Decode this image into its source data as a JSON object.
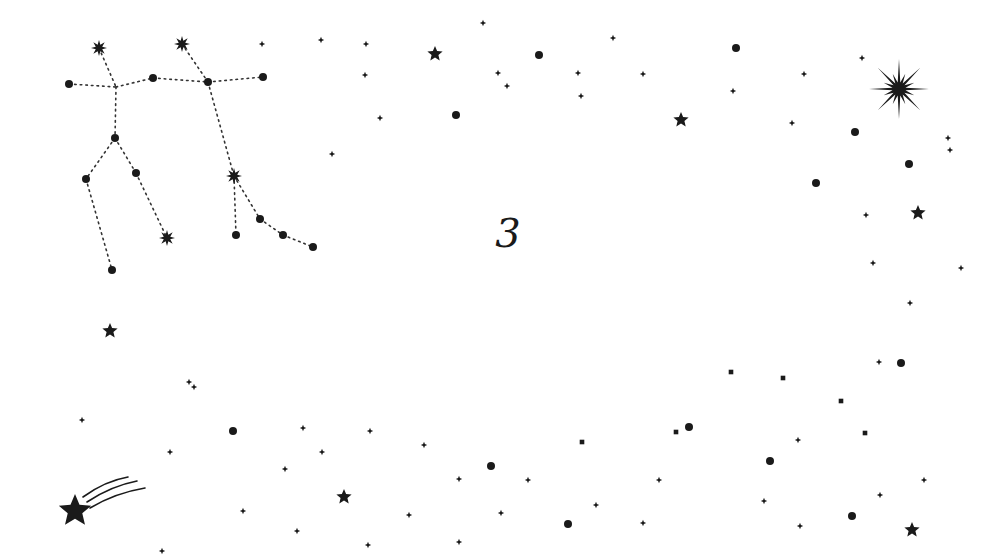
{
  "scene": {
    "background": "#ffffff",
    "ink_color": "#1a1a1a",
    "center_label": "3"
  },
  "constellation": {
    "name_depicted": "Gemini",
    "nodes": [
      {
        "id": "a",
        "x": 99,
        "y": 48,
        "type": "burst"
      },
      {
        "id": "b",
        "x": 182,
        "y": 44,
        "type": "burst"
      },
      {
        "id": "c",
        "x": 69,
        "y": 84,
        "type": "dot"
      },
      {
        "id": "d",
        "x": 116,
        "y": 87,
        "type": "junction"
      },
      {
        "id": "e",
        "x": 153,
        "y": 78,
        "type": "dot"
      },
      {
        "id": "f",
        "x": 208,
        "y": 82,
        "type": "dot"
      },
      {
        "id": "g",
        "x": 263,
        "y": 77,
        "type": "dot"
      },
      {
        "id": "h",
        "x": 115,
        "y": 138,
        "type": "dot"
      },
      {
        "id": "i",
        "x": 86,
        "y": 179,
        "type": "dot"
      },
      {
        "id": "j",
        "x": 136,
        "y": 173,
        "type": "dot"
      },
      {
        "id": "k",
        "x": 167,
        "y": 238,
        "type": "burst"
      },
      {
        "id": "l",
        "x": 112,
        "y": 270,
        "type": "dot"
      },
      {
        "id": "m",
        "x": 234,
        "y": 176,
        "type": "burst"
      },
      {
        "id": "n",
        "x": 236,
        "y": 235,
        "type": "dot"
      },
      {
        "id": "o",
        "x": 260,
        "y": 219,
        "type": "dot"
      },
      {
        "id": "p",
        "x": 283,
        "y": 235,
        "type": "dot"
      },
      {
        "id": "q",
        "x": 313,
        "y": 247,
        "type": "dot"
      }
    ],
    "edges": [
      [
        "a",
        "d"
      ],
      [
        "c",
        "d"
      ],
      [
        "d",
        "e"
      ],
      [
        "e",
        "f"
      ],
      [
        "f",
        "g"
      ],
      [
        "b",
        "f"
      ],
      [
        "d",
        "h"
      ],
      [
        "h",
        "i"
      ],
      [
        "i",
        "l"
      ],
      [
        "h",
        "j"
      ],
      [
        "j",
        "k"
      ],
      [
        "f",
        "m"
      ],
      [
        "m",
        "n"
      ],
      [
        "m",
        "o"
      ],
      [
        "o",
        "p"
      ],
      [
        "p",
        "q"
      ]
    ]
  },
  "stars": {
    "diamonds": [
      [
        262,
        44
      ],
      [
        321,
        40
      ],
      [
        366,
        44
      ],
      [
        365,
        75
      ],
      [
        380,
        118
      ],
      [
        332,
        154
      ],
      [
        483,
        23
      ],
      [
        498,
        73
      ],
      [
        507,
        86
      ],
      [
        578,
        73
      ],
      [
        581,
        96
      ],
      [
        613,
        38
      ],
      [
        643,
        74
      ],
      [
        733,
        91
      ],
      [
        804,
        74
      ],
      [
        792,
        123
      ],
      [
        862,
        58
      ],
      [
        948,
        138
      ],
      [
        950,
        150
      ],
      [
        866,
        215
      ],
      [
        873,
        263
      ],
      [
        961,
        268
      ],
      [
        910,
        303
      ],
      [
        879,
        362
      ],
      [
        82,
        420
      ],
      [
        189,
        382
      ],
      [
        194,
        387
      ],
      [
        170,
        452
      ],
      [
        243,
        511
      ],
      [
        303,
        428
      ],
      [
        285,
        469
      ],
      [
        370,
        431
      ],
      [
        322,
        452
      ],
      [
        424,
        445
      ],
      [
        459,
        479
      ],
      [
        297,
        531
      ],
      [
        368,
        545
      ],
      [
        409,
        515
      ],
      [
        459,
        542
      ],
      [
        501,
        513
      ],
      [
        528,
        480
      ],
      [
        162,
        551
      ],
      [
        659,
        480
      ],
      [
        643,
        523
      ],
      [
        596,
        505
      ],
      [
        798,
        440
      ],
      [
        764,
        501
      ],
      [
        800,
        526
      ],
      [
        880,
        495
      ],
      [
        924,
        480
      ]
    ],
    "squares": [
      [
        582,
        442
      ],
      [
        676,
        432
      ],
      [
        731,
        372
      ],
      [
        783,
        378
      ],
      [
        841,
        401
      ],
      [
        865,
        433
      ]
    ],
    "dots": [
      [
        539,
        55
      ],
      [
        456,
        115
      ],
      [
        736,
        48
      ],
      [
        855,
        132
      ],
      [
        909,
        164
      ],
      [
        816,
        183
      ],
      [
        901,
        363
      ],
      [
        233,
        431
      ],
      [
        491,
        466
      ],
      [
        568,
        524
      ],
      [
        689,
        427
      ],
      [
        770,
        461
      ],
      [
        852,
        516
      ]
    ],
    "five_point": [
      {
        "x": 435,
        "y": 54,
        "r": 8
      },
      {
        "x": 681,
        "y": 120,
        "r": 8
      },
      {
        "x": 918,
        "y": 213,
        "r": 8
      },
      {
        "x": 110,
        "y": 331,
        "r": 8
      },
      {
        "x": 344,
        "y": 497,
        "r": 8
      },
      {
        "x": 912,
        "y": 530,
        "r": 8
      }
    ],
    "big_burst": {
      "x": 899,
      "y": 89,
      "r": 30
    },
    "shooting_star": {
      "x": 75,
      "y": 511,
      "r": 17
    }
  }
}
